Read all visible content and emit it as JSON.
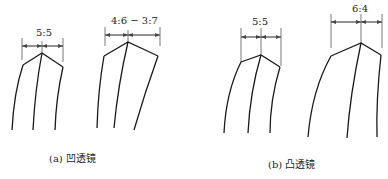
{
  "figure": {
    "panels": [
      {
        "id": "a",
        "caption": "(a) 凹透镜",
        "shapes": [
          {
            "ratio_label": "5:5"
          },
          {
            "ratio_label": "4:6 − 3:7"
          }
        ]
      },
      {
        "id": "b",
        "caption": "(b) 凸透镜",
        "shapes": [
          {
            "ratio_label": "5:5"
          },
          {
            "ratio_label": "6:4"
          }
        ]
      }
    ],
    "colors": {
      "line": "#1a1a1a",
      "dimension": "#444444",
      "background": "#ffffff"
    }
  }
}
